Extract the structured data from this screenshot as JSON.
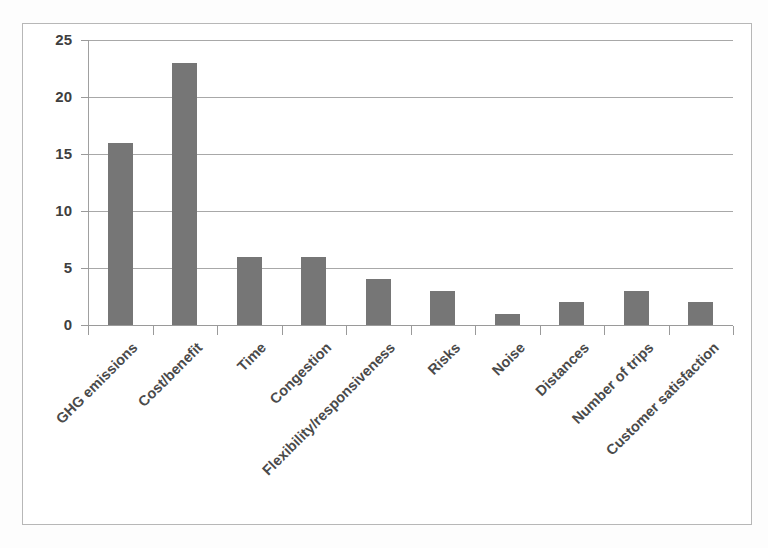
{
  "chart_data": {
    "type": "bar",
    "title": "",
    "subtitle": "",
    "xlabel": "",
    "ylabel": "",
    "ylim": [
      0,
      25
    ],
    "yticks": [
      0,
      5,
      10,
      15,
      20,
      25
    ],
    "grid": true,
    "legend": false,
    "legend_position": "none",
    "orientation": "vertical",
    "bar_color": "#767676",
    "gridline_color": "#a8a8a8",
    "categories": [
      "GHG emissions",
      "Cost/benefit",
      "Time",
      "Congestion",
      "Flexibility/responsiveness",
      "Risks",
      "Noise",
      "Distances",
      "Number of trips",
      "Customer satisfaction"
    ],
    "values": [
      16,
      23,
      6,
      6,
      4,
      3,
      1,
      2,
      3,
      2
    ]
  },
  "axis": {
    "y_tick_labels": [
      "0",
      "5",
      "10",
      "15",
      "20",
      "25"
    ]
  }
}
